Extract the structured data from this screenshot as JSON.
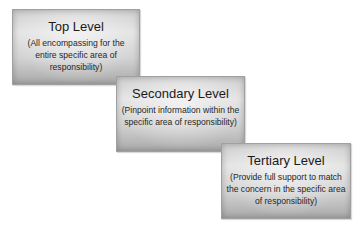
{
  "diagram": {
    "levels": [
      {
        "title": "Top Level",
        "description": "(All encompassing for the entire specific area of responsibility)"
      },
      {
        "title": "Secondary Level",
        "description": "(Pinpoint information within the specific area of responsibility)"
      },
      {
        "title": "Tertiary Level",
        "description": "(Provide full support to match the concern in the specific area of responsibility)"
      }
    ],
    "colors": {
      "box_light": "#e4e4e4",
      "box_dark": "#a9a9a9",
      "text": "#222222",
      "background": "#ffffff"
    }
  }
}
